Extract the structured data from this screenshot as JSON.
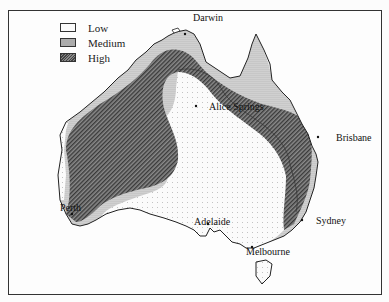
{
  "map": {
    "title": "",
    "region": "Australia",
    "legend": [
      {
        "key": "low",
        "label": "Low",
        "fill": "light dotted"
      },
      {
        "key": "medium",
        "label": "Medium",
        "fill": "dense stipple"
      },
      {
        "key": "high",
        "label": "High",
        "fill": "dark hatched"
      }
    ],
    "cities": [
      {
        "name": "Darwin",
        "x": 193,
        "y": 12
      },
      {
        "name": "Alice Springs",
        "x": 209,
        "y": 102
      },
      {
        "name": "Brisbane",
        "x": 336,
        "y": 134
      },
      {
        "name": "Perth",
        "x": 60,
        "y": 203
      },
      {
        "name": "Adelaide",
        "x": 194,
        "y": 218
      },
      {
        "name": "Sydney",
        "x": 316,
        "y": 216
      },
      {
        "name": "Melbourne",
        "x": 246,
        "y": 247
      }
    ],
    "colors": {
      "low": "#fafafa",
      "medium": "#dcdcdc",
      "high": "#5a5a5a",
      "border": "#222222"
    }
  }
}
